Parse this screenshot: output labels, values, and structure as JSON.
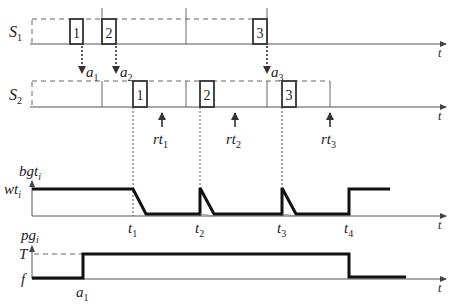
{
  "diagram": {
    "rows": {
      "s1": {
        "label": "S",
        "sub": "1"
      },
      "s2": {
        "label": "S",
        "sub": "2"
      }
    },
    "time_axis_label": "t",
    "s1_boxes": [
      "1",
      "2",
      "3"
    ],
    "s2_boxes": [
      "1",
      "2",
      "3"
    ],
    "arrivals": [
      {
        "label": "a",
        "sub": "1"
      },
      {
        "label": "a",
        "sub": "2"
      },
      {
        "label": "a",
        "sub": "3"
      }
    ],
    "response_times": [
      {
        "label": "rt",
        "sub": "1"
      },
      {
        "label": "rt",
        "sub": "2"
      },
      {
        "label": "rt",
        "sub": "3"
      }
    ],
    "bgt_chart": {
      "y_label": "bgt",
      "y_sub": "i",
      "level_label": "wt",
      "level_sub": "i",
      "x_label": "t",
      "ticks": [
        {
          "label": "t",
          "sub": "1"
        },
        {
          "label": "t",
          "sub": "2"
        },
        {
          "label": "t",
          "sub": "3"
        },
        {
          "label": "t",
          "sub": "4"
        }
      ]
    },
    "pg_chart": {
      "y_label": "pg",
      "y_sub": "i",
      "high_label": "T",
      "low_label": "f",
      "x_label": "t",
      "tick": {
        "label": "a",
        "sub": "1"
      }
    }
  }
}
